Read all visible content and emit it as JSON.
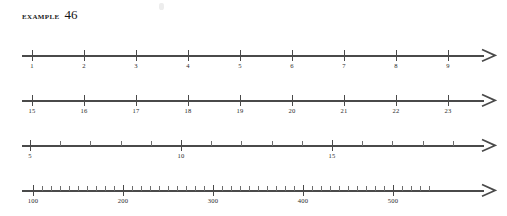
{
  "header": {
    "label": "EXAMPLE",
    "number": "46"
  },
  "colors": {
    "axis": "#4a4a4a",
    "minor_tick": "#6d6d6d",
    "text": "#2b2b2b",
    "background": "#ffffff"
  },
  "chart_data": {
    "type": "number-line",
    "lines": [
      {
        "name": "number-line-1",
        "axis_start_px": 22,
        "axis_end_px": 484,
        "top_px": 45,
        "major_start_px": 32,
        "major_step_px": 52.0,
        "labels": [
          "1",
          "2",
          "3",
          "4",
          "5",
          "6",
          "7",
          "8",
          "9"
        ],
        "values": [
          1,
          2,
          3,
          4,
          5,
          6,
          7,
          8,
          9
        ],
        "minor_per_interval": 0,
        "minor_step_value": 0,
        "arrow": "right"
      },
      {
        "name": "number-line-2",
        "axis_start_px": 22,
        "axis_end_px": 484,
        "top_px": 90,
        "major_start_px": 32,
        "major_step_px": 52.0,
        "labels": [
          "15",
          "16",
          "17",
          "18",
          "19",
          "20",
          "21",
          "22",
          "23"
        ],
        "values": [
          15,
          16,
          17,
          18,
          19,
          20,
          21,
          22,
          23
        ],
        "minor_per_interval": 0,
        "minor_step_value": 0,
        "arrow": "right"
      },
      {
        "name": "number-line-3",
        "axis_start_px": 22,
        "axis_end_px": 484,
        "top_px": 135,
        "major_start_px": 30,
        "major_step_px": 151.0,
        "labels": [
          "5",
          "10",
          "15"
        ],
        "values": [
          5,
          10,
          15
        ],
        "minor_per_interval": 4,
        "minor_step_value": 1,
        "minor_trailing": 4,
        "arrow": "right"
      },
      {
        "name": "number-line-4",
        "axis_start_px": 22,
        "axis_end_px": 484,
        "top_px": 180,
        "major_start_px": 33,
        "major_step_px": 90.0,
        "labels": [
          "100",
          "200",
          "300",
          "400",
          "500"
        ],
        "values": [
          100,
          200,
          300,
          400,
          500
        ],
        "minor_per_interval": 9,
        "minor_step_value": 10,
        "minor_trailing": 4,
        "arrow": "right"
      }
    ]
  }
}
